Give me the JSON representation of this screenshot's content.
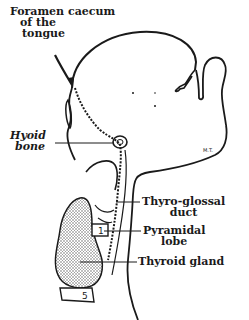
{
  "figure": {
    "colors": {
      "ink": "#1a1a1a",
      "stipple": "#8a8a8a",
      "background": "#ffffff"
    },
    "labels": {
      "foramen_caecum": {
        "line1": "Foramen caecum",
        "line2": "of the",
        "line3": "tongue"
      },
      "hyoid_bone": {
        "line1": "Hyoid",
        "line2": "bone"
      },
      "thyro_glossal_duct": {
        "line1": "Thyro-glossal",
        "line2": "duct"
      },
      "pyramidal_lobe": {
        "line1": "Pyramidal",
        "line2": "lobe"
      },
      "thyroid_gland": {
        "line1": "Thyroid gland"
      }
    },
    "annotations": {
      "signature": "M.T.",
      "cartilage_number_1": "1",
      "cartilage_number_5": "5"
    }
  }
}
